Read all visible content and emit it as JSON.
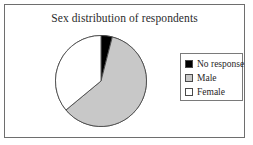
{
  "frame": {
    "border_color": "#6e6e6e",
    "background": "#ffffff"
  },
  "chart": {
    "title": "Sex distribution of respondents"
  },
  "legend": {
    "items": [
      {
        "label": "No response",
        "color": "#000000",
        "swatch": "black-swatch"
      },
      {
        "label": "Male",
        "color": "#c8c8c8",
        "swatch": "gray-swatch"
      },
      {
        "label": "Female",
        "color": "#ffffff",
        "swatch": "white-swatch"
      }
    ]
  },
  "chart_data": {
    "type": "pie",
    "title": "Sex distribution of respondents",
    "categories": [
      "No response",
      "Male",
      "Female"
    ],
    "values": [
      4,
      60,
      36
    ],
    "unit": "percent",
    "colors": [
      "#000000",
      "#c8c8c8",
      "#ffffff"
    ],
    "slice_border_color": "#4a4a4a",
    "start_angle_deg": 0,
    "direction": "clockwise",
    "legend_position": "right",
    "xlabel": "",
    "ylabel": "",
    "grid": false
  }
}
